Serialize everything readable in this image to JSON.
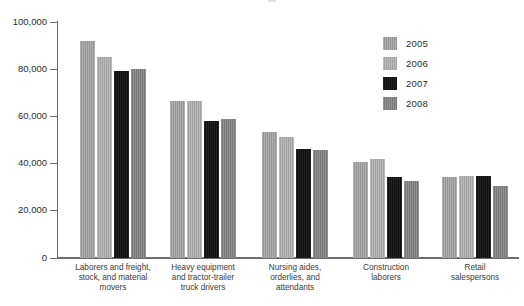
{
  "chart_data": {
    "type": "bar",
    "title": "",
    "subtitle": "",
    "xlabel": "",
    "ylabel": "",
    "ylim": [
      0,
      100000
    ],
    "yticks": [
      0,
      20000,
      40000,
      60000,
      80000,
      100000
    ],
    "ytick_labels": [
      "0",
      "20,000",
      "40,000",
      "60,000",
      "80,000",
      "100,000"
    ],
    "grid": false,
    "legend_position": "top-right",
    "categories": [
      "Laborers and freight,\nstock, and material\nmovers",
      "Heavy equipment\nand tractor-trailer\ntruck drivers",
      "Nursing aides,\norderlies, and\nattendants",
      "Construction\nlaborers",
      "Retail\nsalespersons"
    ],
    "series": [
      {
        "name": "2005",
        "color": "#9d9d9d",
        "values": [
          92000,
          66500,
          53500,
          40500,
          34000
        ]
      },
      {
        "name": "2006",
        "color": "#a8a8a8",
        "values": [
          85000,
          66500,
          51000,
          42000,
          34500
        ]
      },
      {
        "name": "2007",
        "color": "#121212",
        "values": [
          79000,
          58000,
          46000,
          34000,
          34500
        ]
      },
      {
        "name": "2008",
        "color": "#7e7e7e",
        "values": [
          80000,
          59000,
          45500,
          32500,
          30500
        ]
      }
    ]
  },
  "legend": {
    "items": [
      {
        "label": "2005",
        "swatch_name": "legend-swatch-2005"
      },
      {
        "label": "2006",
        "swatch_name": "legend-swatch-2006"
      },
      {
        "label": "2007",
        "swatch_name": "legend-swatch-2007"
      },
      {
        "label": "2008",
        "swatch_name": "legend-swatch-2008"
      }
    ]
  },
  "axes": {
    "y_axis_color": "#6d6d6d",
    "x_axis_color": "#6d6d6d"
  }
}
